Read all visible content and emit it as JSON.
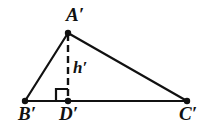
{
  "figure": {
    "background_color": "#ffffff",
    "stroke_color": "#111111"
  },
  "labels": {
    "apex": "A′",
    "base_left": "B′",
    "foot": "D′",
    "base_right": "C′",
    "altitude": "h′"
  },
  "geometry": {
    "points": {
      "A": {
        "x": 68,
        "y": 33
      },
      "B": {
        "x": 25,
        "y": 101
      },
      "D": {
        "x": 68,
        "y": 101
      },
      "C": {
        "x": 187,
        "y": 101
      }
    },
    "segments": [
      {
        "name": "side-AB",
        "from": "A",
        "to": "B",
        "style": "solid"
      },
      {
        "name": "side-AC",
        "from": "A",
        "to": "C",
        "style": "solid"
      },
      {
        "name": "base-BC",
        "from": "B",
        "to": "C",
        "style": "solid"
      },
      {
        "name": "altitude-AD",
        "from": "A",
        "to": "D",
        "style": "dashed"
      }
    ],
    "right_angle_marker": {
      "at": "D",
      "size": 12,
      "side": "left"
    },
    "vertex_dot_radius": 3.2,
    "stroke_width": 2.2,
    "dash_pattern": "7 4"
  }
}
